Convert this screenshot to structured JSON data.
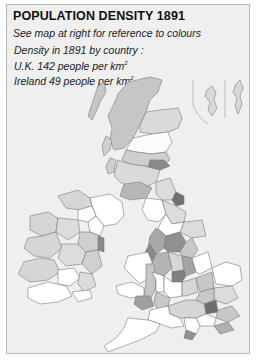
{
  "title": "POPULATION DENSITY 1891",
  "subtitle": "See map at right for reference to colours",
  "facts": {
    "heading": "Density in 1891 by country :",
    "uk_prefix": "U.K. 142 people per km",
    "ireland_prefix": "Ireland 49  people per km",
    "superscript": "2"
  },
  "map": {
    "subject": "British Isles population density by county, 1891",
    "insets": [
      "Orkney Islands",
      "Shetland Islands"
    ],
    "colors": {
      "panel_bg": "#efefef",
      "border": "#b8b8b8",
      "lowest": "#ffffff",
      "low": "#dcdcdc",
      "medium": "#c8c8c8",
      "high": "#a8a8a8",
      "highest": "#808080",
      "outline": "#7a7a7a"
    }
  }
}
